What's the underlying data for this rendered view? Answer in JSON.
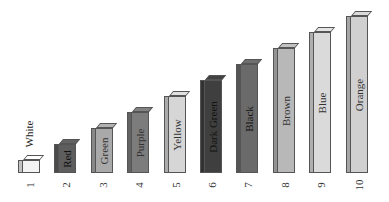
{
  "chart_data": {
    "type": "bar",
    "style": "3d",
    "title": "",
    "xlabel": "",
    "ylabel": "",
    "categories": [
      "1",
      "2",
      "3",
      "4",
      "5",
      "6",
      "7",
      "8",
      "9",
      "10"
    ],
    "values": [
      1,
      2,
      3,
      4,
      5,
      6,
      7,
      8,
      9,
      10
    ],
    "bar_labels": [
      "White",
      "Red",
      "Green",
      "Purple",
      "Yellow",
      "Dark Green",
      "Black",
      "Brown",
      "Blue",
      "Orange"
    ],
    "bar_fills": [
      "#f4f4f4",
      "#5e5e5e",
      "#a9a9a9",
      "#7c7c7c",
      "#d6d6d6",
      "#3f3f3f",
      "#6a6a6a",
      "#b8b8b8",
      "#dadada",
      "#d0d0d0"
    ],
    "grid": false,
    "legend": "none",
    "ylim": [
      0,
      10
    ]
  }
}
